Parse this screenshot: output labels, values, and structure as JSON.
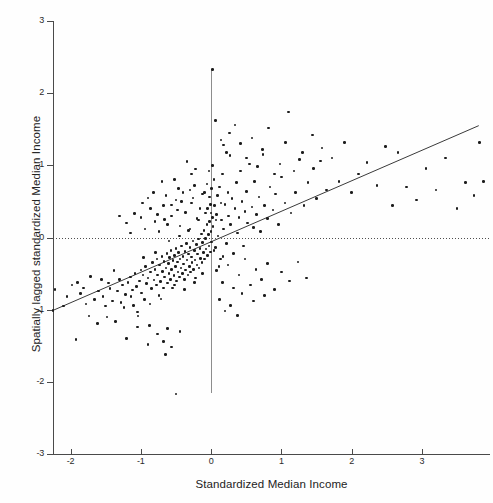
{
  "chart_data": {
    "type": "scatter",
    "title": "",
    "xlabel": "Standardized Median Income",
    "ylabel": "Spatially lagged standardized Median Income",
    "xlim": [
      -2.25,
      3.97
    ],
    "ylim": [
      -3,
      3
    ],
    "xticks": [
      -2,
      -1,
      0,
      1,
      2,
      3
    ],
    "xtick_labels": [
      "-2",
      "-1",
      "0",
      "1",
      "2",
      "3"
    ],
    "yticks": [
      3,
      2,
      1,
      0,
      -1,
      -2,
      -3
    ],
    "ytick_labels": [
      "3",
      "2",
      "1",
      "0",
      "-1",
      "-2",
      "-3"
    ],
    "grid": false,
    "legend": null,
    "marker_color": "#1c1c1c",
    "marker_size": 2.6,
    "reference_lines": [
      {
        "name": "vertical-mean-line",
        "orientation": "vertical",
        "value": 0,
        "style": "solid",
        "color": "#8d8d8d"
      },
      {
        "name": "horizontal-mean-line",
        "orientation": "horizontal",
        "value": 0,
        "style": "dotted",
        "color": "#4f4f4f"
      }
    ],
    "fit_line": {
      "name": "moran-regression-line",
      "style": "solid",
      "color": "#3a3a3a",
      "x0": -2.25,
      "y0": -1.01,
      "x1": 3.81,
      "y1": 1.55,
      "slope": 0.423,
      "intercept": -0.06
    },
    "points": [
      [
        -2.25,
        -1.01
      ],
      [
        -2.22,
        -0.72
      ],
      [
        -1.92,
        -1.41
      ],
      [
        -1.86,
        -0.78
      ],
      [
        -1.82,
        -0.7
      ],
      [
        -1.74,
        -1.09
      ],
      [
        -1.66,
        -0.86
      ],
      [
        -1.62,
        -1.19
      ],
      [
        -1.54,
        -0.82
      ],
      [
        -1.5,
        -0.95
      ],
      [
        -1.46,
        -0.63
      ],
      [
        -1.44,
        -0.71
      ],
      [
        -1.4,
        -0.88
      ],
      [
        -1.36,
        -1.16
      ],
      [
        -1.33,
        -0.74
      ],
      [
        -1.3,
        -0.58
      ],
      [
        -1.28,
        -0.9
      ],
      [
        -1.26,
        -0.66
      ],
      [
        -1.22,
        -0.79
      ],
      [
        -1.2,
        -1.4
      ],
      [
        -1.18,
        -0.62
      ],
      [
        -1.15,
        -0.55
      ],
      [
        -1.12,
        -0.73
      ],
      [
        -1.1,
        -0.94
      ],
      [
        -1.08,
        -0.5
      ],
      [
        -1.06,
        -0.68
      ],
      [
        -1.04,
        -1.09
      ],
      [
        -1.02,
        -0.6
      ],
      [
        -1.0,
        -0.45
      ],
      [
        -0.99,
        -0.77
      ],
      [
        -0.97,
        -0.52
      ],
      [
        -0.95,
        -0.86
      ],
      [
        -0.93,
        -0.4
      ],
      [
        -0.92,
        -0.64
      ],
      [
        -0.9,
        -0.56
      ],
      [
        -0.88,
        -1.22
      ],
      [
        -0.86,
        -0.48
      ],
      [
        -0.85,
        -0.71
      ],
      [
        -0.83,
        -0.35
      ],
      [
        -0.81,
        -0.59
      ],
      [
        -0.8,
        -0.44
      ],
      [
        -0.78,
        -0.66
      ],
      [
        -0.77,
        -0.3
      ],
      [
        -0.76,
        -0.52
      ],
      [
        -0.74,
        -0.8
      ],
      [
        -0.73,
        -0.38
      ],
      [
        -0.72,
        -0.61
      ],
      [
        -0.7,
        -0.26
      ],
      [
        -0.69,
        -0.47
      ],
      [
        -0.68,
        -0.7
      ],
      [
        -0.67,
        -0.33
      ],
      [
        -0.66,
        -0.55
      ],
      [
        -0.65,
        -1.62
      ],
      [
        -0.64,
        -0.42
      ],
      [
        -0.63,
        -0.22
      ],
      [
        -0.62,
        -0.63
      ],
      [
        -0.61,
        -0.36
      ],
      [
        -0.6,
        -0.5
      ],
      [
        -0.59,
        -0.28
      ],
      [
        -0.58,
        -0.58
      ],
      [
        -0.57,
        -0.18
      ],
      [
        -0.56,
        -0.44
      ],
      [
        -0.55,
        -0.7
      ],
      [
        -0.54,
        -0.32
      ],
      [
        -0.53,
        -0.53
      ],
      [
        -0.52,
        -0.25
      ],
      [
        -0.51,
        -0.4
      ],
      [
        -0.5,
        -0.15
      ],
      [
        -0.49,
        -0.6
      ],
      [
        -0.48,
        -0.34
      ],
      [
        -0.47,
        -0.48
      ],
      [
        -0.46,
        -0.21
      ],
      [
        -0.45,
        -0.55
      ],
      [
        -0.44,
        -0.3
      ],
      [
        -0.43,
        -0.42
      ],
      [
        -0.42,
        -0.12
      ],
      [
        -0.41,
        -0.5
      ],
      [
        -0.4,
        -0.26
      ],
      [
        -0.39,
        -0.37
      ],
      [
        -0.38,
        -0.58
      ],
      [
        -0.37,
        -0.19
      ],
      [
        -0.36,
        -0.45
      ],
      [
        -0.35,
        -0.08
      ],
      [
        -0.34,
        -0.31
      ],
      [
        -0.33,
        -0.52
      ],
      [
        -0.32,
        -0.23
      ],
      [
        -0.31,
        -0.4
      ],
      [
        -0.3,
        -0.14
      ],
      [
        -0.29,
        -0.48
      ],
      [
        -0.28,
        -0.27
      ],
      [
        -0.27,
        -0.35
      ],
      [
        -0.26,
        -0.05
      ],
      [
        -0.25,
        -0.44
      ],
      [
        -0.24,
        -0.18
      ],
      [
        -0.23,
        -0.31
      ],
      [
        -0.22,
        -0.56
      ],
      [
        -0.21,
        -0.1
      ],
      [
        -0.2,
        -0.38
      ],
      [
        -0.19,
        -0.23
      ],
      [
        -0.18,
        -0.02
      ],
      [
        -0.17,
        -0.42
      ],
      [
        -0.16,
        -0.15
      ],
      [
        -0.15,
        -0.29
      ],
      [
        -0.14,
        0.05
      ],
      [
        -0.13,
        -0.35
      ],
      [
        -0.12,
        -0.07
      ],
      [
        -0.11,
        -0.21
      ],
      [
        -0.1,
        0.1
      ],
      [
        -0.09,
        -0.3
      ],
      [
        -0.08,
        -0.01
      ],
      [
        -0.07,
        -0.16
      ],
      [
        -0.06,
        0.18
      ],
      [
        -0.05,
        -0.25
      ],
      [
        -0.04,
        0.04
      ],
      [
        -0.03,
        -0.12
      ],
      [
        -0.02,
        0.22
      ],
      [
        -0.01,
        -0.2
      ],
      [
        0.0,
        0.08
      ],
      [
        0.01,
        -0.06
      ],
      [
        0.02,
        0.28
      ],
      [
        -2.1,
        -0.95
      ],
      [
        -1.98,
        -0.66
      ],
      [
        -1.6,
        -0.74
      ],
      [
        -1.48,
        -1.1
      ],
      [
        -1.38,
        -0.46
      ],
      [
        -1.24,
        -0.97
      ],
      [
        -1.14,
        -0.82
      ],
      [
        -1.05,
        -1.03
      ],
      [
        -0.96,
        -0.28
      ],
      [
        -0.87,
        -0.92
      ],
      [
        -0.79,
        -0.21
      ],
      [
        -0.71,
        -0.85
      ],
      [
        -0.6,
        -0.05
      ],
      [
        -0.52,
        -0.66
      ],
      [
        -0.45,
        0.02
      ],
      [
        -0.38,
        -0.72
      ],
      [
        -0.3,
        0.12
      ],
      [
        -0.24,
        -0.62
      ],
      [
        -0.18,
        0.24
      ],
      [
        -0.12,
        -0.5
      ],
      [
        -1.09,
        0.33
      ],
      [
        -1.0,
        0.28
      ],
      [
        -0.94,
        0.12
      ],
      [
        -0.86,
        0.4
      ],
      [
        -0.8,
        0.22
      ],
      [
        -0.74,
        0.08
      ],
      [
        -0.68,
        0.44
      ],
      [
        -0.62,
        0.18
      ],
      [
        -0.56,
        0.3
      ],
      [
        -0.5,
        0.52
      ],
      [
        -0.44,
        0.16
      ],
      [
        -0.4,
        0.62
      ],
      [
        -0.36,
        0.35
      ],
      [
        -0.32,
        0.1
      ],
      [
        -0.28,
        0.48
      ],
      [
        -0.24,
        0.72
      ],
      [
        -0.2,
        0.26
      ],
      [
        -0.16,
        0.4
      ],
      [
        -0.12,
        0.6
      ],
      [
        -0.08,
        0.34
      ],
      [
        -1.2,
        0.2
      ],
      [
        -1.15,
        0.06
      ],
      [
        -0.9,
        0.55
      ],
      [
        -0.7,
        0.78
      ],
      [
        -0.64,
        0.58
      ],
      [
        -0.52,
        0.8
      ],
      [
        -0.46,
        0.68
      ],
      [
        -0.34,
        1.05
      ],
      [
        -0.28,
        0.88
      ],
      [
        -0.22,
        0.95
      ],
      [
        -0.56,
        0.45
      ],
      [
        -0.48,
        0.38
      ],
      [
        -0.42,
        0.5
      ],
      [
        -0.3,
        0.66
      ],
      [
        -0.26,
        0.55
      ],
      [
        -1.3,
        0.3
      ],
      [
        -0.98,
        0.48
      ],
      [
        -0.82,
        0.62
      ],
      [
        -0.76,
        0.32
      ],
      [
        -0.66,
        0.25
      ],
      [
        0.03,
        0.15
      ],
      [
        0.05,
        0.44
      ],
      [
        0.06,
        -0.14
      ],
      [
        0.08,
        0.32
      ],
      [
        0.09,
        0.58
      ],
      [
        0.1,
        0.02
      ],
      [
        0.12,
        0.7
      ],
      [
        0.13,
        -0.3
      ],
      [
        0.15,
        0.24
      ],
      [
        0.16,
        0.88
      ],
      [
        0.18,
        0.12
      ],
      [
        0.2,
        0.46
      ],
      [
        0.22,
        -0.08
      ],
      [
        0.24,
        0.62
      ],
      [
        0.25,
        0.3
      ],
      [
        0.27,
        1.14
      ],
      [
        0.28,
        0.18
      ],
      [
        0.3,
        0.54
      ],
      [
        0.32,
        -0.22
      ],
      [
        0.34,
        0.4
      ],
      [
        0.36,
        0.76
      ],
      [
        0.38,
        0.06
      ],
      [
        0.4,
        0.28
      ],
      [
        0.42,
        0.92
      ],
      [
        0.44,
        0.5
      ],
      [
        0.46,
        -0.12
      ],
      [
        0.48,
        0.36
      ],
      [
        0.5,
        0.64
      ],
      [
        0.52,
        0.2
      ],
      [
        0.55,
        1.02
      ],
      [
        0.58,
        0.42
      ],
      [
        0.6,
        0.14
      ],
      [
        0.62,
        0.78
      ],
      [
        0.65,
        0.32
      ],
      [
        0.68,
        0.56
      ],
      [
        0.7,
        0.08
      ],
      [
        0.73,
        1.22
      ],
      [
        0.76,
        0.44
      ],
      [
        0.8,
        0.26
      ],
      [
        0.84,
        0.7
      ],
      [
        0.88,
        0.38
      ],
      [
        0.92,
        0.6
      ],
      [
        0.96,
        0.18
      ],
      [
        1.0,
        0.84
      ],
      [
        1.05,
        0.48
      ],
      [
        1.1,
        1.74
      ],
      [
        1.14,
        0.34
      ],
      [
        1.2,
        0.62
      ],
      [
        1.26,
        1.08
      ],
      [
        1.32,
        0.44
      ],
      [
        1.38,
        0.76
      ],
      [
        1.44,
        1.42
      ],
      [
        1.5,
        0.54
      ],
      [
        1.58,
        1.24
      ],
      [
        1.64,
        0.66
      ],
      [
        0.02,
        2.33
      ],
      [
        0.06,
        1.62
      ],
      [
        0.14,
        1.35
      ],
      [
        0.18,
        1.28
      ],
      [
        0.22,
        1.18
      ],
      [
        0.26,
        1.45
      ],
      [
        0.34,
        1.56
      ],
      [
        0.42,
        1.3
      ],
      [
        0.5,
        1.1
      ],
      [
        0.58,
        1.38
      ],
      [
        0.66,
        0.98
      ],
      [
        0.74,
        1.15
      ],
      [
        0.82,
        1.52
      ],
      [
        0.9,
        0.88
      ],
      [
        0.98,
        1.02
      ],
      [
        1.06,
        1.32
      ],
      [
        1.18,
        0.92
      ],
      [
        1.3,
        1.18
      ],
      [
        1.46,
        0.96
      ],
      [
        1.56,
        1.06
      ],
      [
        1.72,
        1.1
      ],
      [
        1.82,
        0.78
      ],
      [
        1.9,
        1.32
      ],
      [
        2.0,
        0.62
      ],
      [
        2.1,
        0.88
      ],
      [
        2.22,
        1.04
      ],
      [
        2.36,
        0.72
      ],
      [
        2.48,
        1.26
      ],
      [
        2.58,
        0.44
      ],
      [
        2.66,
        1.18
      ],
      [
        2.78,
        0.7
      ],
      [
        2.92,
        0.52
      ],
      [
        3.06,
        0.96
      ],
      [
        3.2,
        0.66
      ],
      [
        3.34,
        1.1
      ],
      [
        3.5,
        0.4
      ],
      [
        3.62,
        0.76
      ],
      [
        3.74,
        0.58
      ],
      [
        3.82,
        1.32
      ],
      [
        3.88,
        0.78
      ],
      [
        0.08,
        -0.46
      ],
      [
        0.16,
        -0.62
      ],
      [
        0.24,
        -0.38
      ],
      [
        0.32,
        -0.7
      ],
      [
        0.4,
        -0.52
      ],
      [
        0.48,
        -0.3
      ],
      [
        0.56,
        -0.66
      ],
      [
        0.64,
        -0.44
      ],
      [
        0.72,
        -0.58
      ],
      [
        0.8,
        -0.36
      ],
      [
        0.9,
        -0.72
      ],
      [
        1.0,
        -0.48
      ],
      [
        1.12,
        -0.6
      ],
      [
        1.24,
        -0.34
      ],
      [
        1.36,
        -0.56
      ],
      [
        0.12,
        -0.86
      ],
      [
        0.28,
        -0.94
      ],
      [
        0.44,
        -0.78
      ],
      [
        0.6,
        -0.88
      ],
      [
        0.76,
        -0.8
      ],
      [
        0.2,
        -1.02
      ],
      [
        0.38,
        -1.08
      ],
      [
        -0.5,
        -2.17
      ],
      [
        -0.56,
        -1.52
      ],
      [
        -0.68,
        -1.44
      ],
      [
        -0.44,
        -1.3
      ],
      [
        -0.62,
        -1.26
      ],
      [
        -0.76,
        -1.34
      ],
      [
        -0.9,
        -1.48
      ],
      [
        -1.05,
        -1.24
      ],
      [
        0.04,
        -0.18
      ],
      [
        0.07,
        0.24
      ],
      [
        0.11,
        -0.4
      ],
      [
        0.14,
        0.48
      ],
      [
        0.17,
        -0.26
      ],
      [
        -0.05,
        0.4
      ],
      [
        -0.02,
        0.56
      ],
      [
        0.01,
        0.68
      ],
      [
        0.04,
        0.8
      ],
      [
        0.0,
        0.34
      ],
      [
        -0.09,
        0.62
      ],
      [
        -0.06,
        0.74
      ],
      [
        -0.03,
        0.92
      ],
      [
        0.02,
        1.0
      ],
      [
        -0.01,
        0.46
      ],
      [
        -1.72,
        -0.54
      ],
      [
        -1.9,
        -0.62
      ],
      [
        -2.05,
        -0.82
      ],
      [
        -1.78,
        -0.92
      ],
      [
        -1.56,
        -0.58
      ]
    ]
  },
  "axis_titles": {
    "x": "Standardized Median Income",
    "y": "Spatially lagged standardized Median Income"
  }
}
